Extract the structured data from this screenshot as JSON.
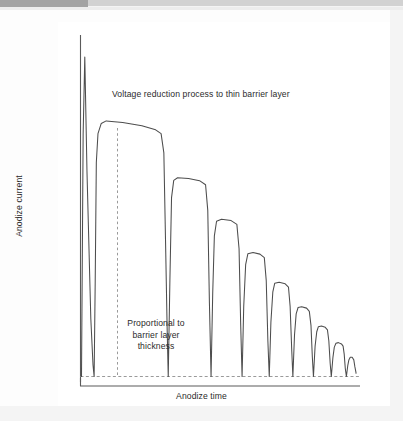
{
  "figure": {
    "kind": "schematic-line-chart",
    "caption_bar_present": true,
    "annotations": {
      "top_note": "Voltage reduction process to thin barrier layer",
      "dashed_note": "Proportional to barrier layer thickness",
      "dashed_note_line1": "Proportional to",
      "dashed_note_line2": "barrier layer",
      "dashed_note_line3": "thickness"
    },
    "colors": {
      "trace": "#4d4d4d",
      "axis": "#5a5a5a",
      "dashed": "#9a9a9a",
      "text": "#2b2b2b",
      "page": "#ffffff",
      "surround": "#f4f4f4",
      "scanbar_dark": "#a3a3a3",
      "scanbar_light": "#d2d2d2"
    }
  },
  "chart_data": {
    "type": "line",
    "title": "",
    "subtitle": "",
    "xlabel": "Anodize time",
    "ylabel": "Anodize current",
    "grid": false,
    "legend": null,
    "axis_ticks": {
      "x": [],
      "y": []
    },
    "xlim": [
      0,
      1
    ],
    "ylim": [
      0,
      1
    ],
    "annotations": [
      {
        "text": "Voltage reduction process to thin barrier layer",
        "x": 0.22,
        "y": 0.93,
        "type": "label"
      },
      {
        "text": "Proportional to barrier layer thickness",
        "x": 0.14,
        "y": 0.16,
        "type": "label-with-dashed-leader"
      }
    ],
    "reference_lines": [
      {
        "orientation": "horizontal",
        "value": 0.0,
        "style": "dashed",
        "label": "baseline current"
      },
      {
        "orientation": "vertical",
        "value": 0.125,
        "style": "dashed",
        "label": "plateau onset marker"
      }
    ],
    "series": [
      {
        "name": "Anodize current",
        "style": "solid",
        "color": "#4d4d4d",
        "comment": "Normalized coordinates: x in [0,1] across the time axis, y in [0,1] where 0 is the dashed baseline and 1 is the top of the initial spike.",
        "points": [
          [
            0.0,
            0.0
          ],
          [
            0.006,
            0.76
          ],
          [
            0.012,
            1.0
          ],
          [
            0.02,
            0.64
          ],
          [
            0.034,
            0.18
          ],
          [
            0.042,
            0.035
          ],
          [
            0.046,
            0.0
          ],
          [
            0.05,
            0.3
          ],
          [
            0.054,
            0.67
          ],
          [
            0.06,
            0.76
          ],
          [
            0.072,
            0.792
          ],
          [
            0.09,
            0.8
          ],
          [
            0.15,
            0.795
          ],
          [
            0.22,
            0.785
          ],
          [
            0.27,
            0.772
          ],
          [
            0.29,
            0.76
          ],
          [
            0.3,
            0.7
          ],
          [
            0.306,
            0.43
          ],
          [
            0.312,
            0.15
          ],
          [
            0.316,
            0.0
          ],
          [
            0.322,
            0.3
          ],
          [
            0.328,
            0.56
          ],
          [
            0.336,
            0.614
          ],
          [
            0.35,
            0.622
          ],
          [
            0.39,
            0.62
          ],
          [
            0.43,
            0.613
          ],
          [
            0.452,
            0.6
          ],
          [
            0.46,
            0.52
          ],
          [
            0.466,
            0.23
          ],
          [
            0.472,
            0.0
          ],
          [
            0.478,
            0.26
          ],
          [
            0.484,
            0.44
          ],
          [
            0.492,
            0.486
          ],
          [
            0.51,
            0.492
          ],
          [
            0.545,
            0.488
          ],
          [
            0.566,
            0.476
          ],
          [
            0.574,
            0.4
          ],
          [
            0.58,
            0.16
          ],
          [
            0.585,
            0.0
          ],
          [
            0.591,
            0.22
          ],
          [
            0.598,
            0.35
          ],
          [
            0.606,
            0.384
          ],
          [
            0.625,
            0.388
          ],
          [
            0.65,
            0.383
          ],
          [
            0.666,
            0.372
          ],
          [
            0.673,
            0.3
          ],
          [
            0.679,
            0.11
          ],
          [
            0.684,
            0.0
          ],
          [
            0.69,
            0.17
          ],
          [
            0.697,
            0.265
          ],
          [
            0.704,
            0.292
          ],
          [
            0.72,
            0.295
          ],
          [
            0.742,
            0.29
          ],
          [
            0.754,
            0.28
          ],
          [
            0.76,
            0.22
          ],
          [
            0.766,
            0.08
          ],
          [
            0.77,
            0.0
          ],
          [
            0.776,
            0.13
          ],
          [
            0.782,
            0.196
          ],
          [
            0.789,
            0.216
          ],
          [
            0.802,
            0.218
          ],
          [
            0.82,
            0.214
          ],
          [
            0.83,
            0.204
          ],
          [
            0.836,
            0.16
          ],
          [
            0.841,
            0.06
          ],
          [
            0.845,
            0.0
          ],
          [
            0.851,
            0.095
          ],
          [
            0.857,
            0.14
          ],
          [
            0.863,
            0.156
          ],
          [
            0.874,
            0.158
          ],
          [
            0.888,
            0.154
          ],
          [
            0.896,
            0.146
          ],
          [
            0.901,
            0.112
          ],
          [
            0.906,
            0.04
          ],
          [
            0.91,
            0.0
          ],
          [
            0.916,
            0.06
          ],
          [
            0.921,
            0.092
          ],
          [
            0.927,
            0.104
          ],
          [
            0.936,
            0.106
          ],
          [
            0.947,
            0.102
          ],
          [
            0.953,
            0.095
          ],
          [
            0.957,
            0.07
          ],
          [
            0.961,
            0.025
          ],
          [
            0.965,
            0.0
          ],
          [
            0.97,
            0.034
          ],
          [
            0.974,
            0.052
          ],
          [
            0.979,
            0.06
          ],
          [
            0.986,
            0.06
          ],
          [
            0.992,
            0.052
          ],
          [
            0.996,
            0.03
          ],
          [
            1.0,
            0.012
          ],
          [
            1.0,
            0.01
          ]
        ]
      }
    ]
  }
}
